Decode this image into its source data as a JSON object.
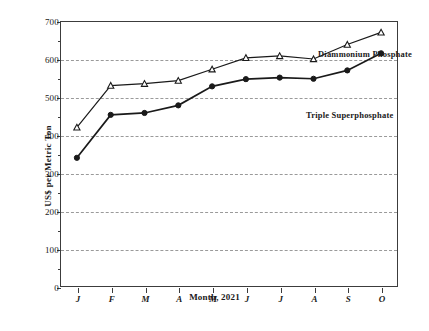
{
  "chart_data": {
    "type": "line",
    "title": "",
    "xlabel": "Month, 2021",
    "ylabel": "US$ per Metric Ton",
    "categories": [
      "J",
      "F",
      "M",
      "A",
      "M",
      "J",
      "J",
      "A",
      "S",
      "O"
    ],
    "ylim": [
      0,
      700
    ],
    "ytick_labels": [
      "0",
      "100",
      "200",
      "300",
      "400",
      "500",
      "600",
      "700"
    ],
    "yticks": [
      0,
      100,
      200,
      300,
      400,
      500,
      600,
      700
    ],
    "grid": true,
    "grid_axis": "y",
    "legend_position": "inline-annotations",
    "series": [
      {
        "name": "Diammonium Phosphate",
        "marker": "triangle-up",
        "color": "#1a1a1a",
        "values": [
          420,
          530,
          535,
          543,
          573,
          603,
          608,
          600,
          638,
          670
        ]
      },
      {
        "name": "Triple Superphosphate",
        "marker": "circle",
        "color": "#1a1a1a",
        "values": [
          340,
          453,
          458,
          478,
          528,
          547,
          551,
          548,
          570,
          615
        ]
      }
    ],
    "annotations": [
      {
        "text": "Diammonium Phosphate",
        "series": "Diammonium Phosphate"
      },
      {
        "text": "Triple Superphosphate",
        "series": "Triple Superphosphate"
      }
    ]
  },
  "axes": {
    "y_title": "US$ per Metric Ton",
    "x_title": "Month, 2021"
  },
  "colors": {
    "line": "#1a1a1a",
    "frame": "#3c3c3c",
    "grid": "#9a9a9a",
    "background": "#ffffff"
  }
}
